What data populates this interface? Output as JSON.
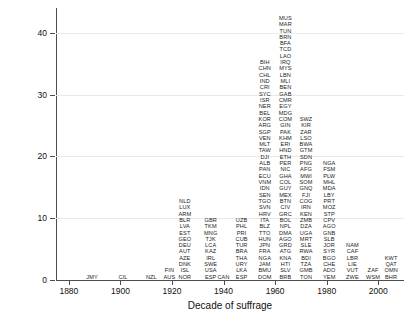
{
  "chart_data": {
    "type": "bar",
    "title": "",
    "xlabel": "Decade of suffrage",
    "ylabel": "Number of countries",
    "xlim": [
      1875,
      2010
    ],
    "ylim": [
      0,
      44
    ],
    "xticks": [
      "1880",
      "1900",
      "1920",
      "1940",
      "1960",
      "1980",
      "2000"
    ],
    "xtick_values": [
      1880,
      1900,
      1920,
      1940,
      1960,
      1980,
      2000
    ],
    "yticks": [
      "0",
      "10",
      "20",
      "30",
      "40"
    ],
    "ytick_values": [
      0,
      10,
      20,
      30,
      40
    ],
    "grid": "horizontal",
    "legend": "none",
    "note": "Each country code is stacked as one unit at its decade of suffrage; column height equals number of countries.",
    "categories": [
      1890,
      1900,
      1910,
      1920,
      1930,
      1940,
      1950,
      1960,
      1970,
      1980,
      1990,
      2000
    ],
    "values": [
      1,
      1,
      2,
      8,
      7,
      18,
      23,
      43,
      25,
      9,
      5,
      4
    ],
    "series": [
      {
        "decade": 1890,
        "count": 1,
        "codes": [
          "JMY"
        ]
      },
      {
        "decade": 1900,
        "count": 1,
        "codes": [
          "CIL"
        ]
      },
      {
        "decade": 1910,
        "count": 2,
        "codes": [
          "FIN",
          "NZL"
        ]
      },
      {
        "decade": 1920,
        "count": 8,
        "codes": [
          "NOR",
          "ISL",
          "DNK",
          "AZE",
          "AUT",
          "DEU",
          "GEO",
          "EST",
          "LVA",
          "BLR",
          "ARM",
          "LUX",
          "NLD"
        ]
      },
      {
        "decade": 1930,
        "count": 7,
        "codes": [
          "CAN",
          "USA",
          "SWE",
          "IRL",
          "KAZ",
          "LCA",
          "TJK",
          "MNG",
          "TKM",
          "GBR"
        ]
      },
      {
        "decade": 1940,
        "count": 18,
        "codes": [
          "ESP",
          "LKA",
          "URY",
          "THA",
          "BRA",
          "TUR",
          "CUB",
          "PRI",
          "PHL",
          "UZB"
        ]
      },
      {
        "decade": 1950,
        "count": 23,
        "codes": [
          "DOM",
          "BMU",
          "JAM",
          "NGA",
          "FRA",
          "JPN",
          "HUN",
          "TTO",
          "BLZ",
          "ITA",
          "HRV",
          "SVN",
          "TGO",
          "SEN",
          "IDN",
          "VNM",
          "ECU",
          "PAN",
          "ALB",
          "DJI",
          "TAW",
          "MLT",
          "VEN",
          "SGP",
          "ARG",
          "KOR",
          "BEL",
          "NER",
          "ISR",
          "SYC",
          "CRI",
          "IND",
          "CHL",
          "CHN",
          "BIH"
        ]
      },
      {
        "decade": 1960,
        "count": 43,
        "codes": [
          "BRB",
          "SLV",
          "HTI",
          "KNA",
          "ATG",
          "GRD",
          "AGO",
          "DMA",
          "NPL",
          "BOL",
          "GRC",
          "CIV",
          "BTN",
          "MEX",
          "GUY",
          "COL",
          "GHA",
          "NIC",
          "PER",
          "ETH",
          "HND",
          "ERI",
          "KHM",
          "PAK",
          "GIN",
          "COM",
          "MDG",
          "EGY",
          "CMR",
          "GAB",
          "BEN",
          "MLI",
          "LBN",
          "MYS",
          "IRQ",
          "LAO",
          "TCD",
          "BFA",
          "BRN",
          "TUN",
          "MAR",
          "MUS"
        ]
      },
      {
        "decade": 1970,
        "count": 25,
        "codes": [
          "TON",
          "GMB",
          "TZA",
          "BDI",
          "RWA",
          "SLE",
          "MRT",
          "UGA",
          "DZA",
          "ZMB",
          "KEN",
          "IRN",
          "COG",
          "FJI",
          "GNQ",
          "SOM",
          "MWI",
          "AFG",
          "PNG",
          "SDN",
          "GTM",
          "BWA",
          "LSO",
          "ZAR",
          "KIR",
          "SWZ"
        ]
      },
      {
        "decade": 1980,
        "count": 9,
        "codes": [
          "YEM",
          "ADO",
          "CHE",
          "BGO",
          "SYR",
          "JOR",
          "SLB",
          "GNB",
          "AGO",
          "CPV",
          "STP",
          "MOZ",
          "PRT",
          "LBY",
          "MDA",
          "MHL",
          "PLW",
          "FSM",
          "NGA"
        ]
      },
      {
        "decade": 1990,
        "count": 5,
        "codes": [
          "ZWE",
          "VUT",
          "LIE",
          "LBR",
          "CAF",
          "NAM"
        ]
      },
      {
        "decade": 2000,
        "count": 4,
        "codes": [
          "BHR",
          "OMN",
          "QAT",
          "KWT"
        ]
      }
    ],
    "columns": [
      {
        "x": 1889,
        "codes": [
          "JMY"
        ]
      },
      {
        "x": 1901,
        "codes": [
          "CIL"
        ]
      },
      {
        "x": 1912,
        "codes": [
          "NZL"
        ]
      },
      {
        "x": 1919,
        "codes": [
          "AUS",
          "FIN"
        ]
      },
      {
        "x": 1925,
        "codes": [
          "NOR",
          "ISL",
          "DNK",
          "AZE",
          "AUT",
          "DEU",
          "GEO",
          "EST",
          "LVA",
          "BLR",
          "ARM",
          "LUX",
          "NLD"
        ]
      },
      {
        "x": 1935,
        "codes": [
          "ESP",
          "USA",
          "SWE",
          "IRL",
          "KAZ",
          "LCA",
          "TJK",
          "MNG",
          "TKM",
          "GBR"
        ]
      },
      {
        "x": 1940,
        "codes": [
          "CAN"
        ]
      },
      {
        "x": 1947,
        "codes": [
          "ESP",
          "LKA",
          "URY",
          "THA",
          "BRA",
          "TUR",
          "CUB",
          "PRI",
          "PHL",
          "UZB"
        ]
      },
      {
        "x": 1956,
        "codes": [
          "DOM",
          "BMU",
          "JAM",
          "NGA",
          "FRA",
          "JPN",
          "HUN",
          "TTO",
          "BLZ",
          "ITA",
          "HRV",
          "SVN",
          "TGO",
          "SEN",
          "IDN",
          "VNM",
          "ECU",
          "PAN",
          "ALB",
          "DJI",
          "TAW",
          "MLT",
          "VEN",
          "SGP",
          "ARG",
          "KOR",
          "BEL",
          "NER",
          "ISR",
          "SYC",
          "CRI",
          "IND",
          "CHL",
          "CHN",
          "BIH"
        ]
      },
      {
        "x": 1964,
        "codes": [
          "BRB",
          "SLV",
          "HTI",
          "KNA",
          "ATG",
          "GRD",
          "AGO",
          "DMA",
          "NPL",
          "BOL",
          "GRC",
          "CIV",
          "BTN",
          "MEX",
          "GUY",
          "COL",
          "GHA",
          "NIC",
          "PER",
          "ETH",
          "HND",
          "ERI",
          "KHM",
          "PAK",
          "GIN",
          "COM",
          "MDG",
          "EGY",
          "CMR",
          "GAB",
          "BEN",
          "MLI",
          "LBN",
          "MYS",
          "IRQ",
          "LAO",
          "TCD",
          "BFA",
          "BRN",
          "TUN",
          "MAR",
          "MUS"
        ]
      },
      {
        "x": 1972,
        "codes": [
          "TON",
          "GMB",
          "TZA",
          "BDI",
          "RWA",
          "SLE",
          "MRT",
          "UGA",
          "DZA",
          "ZMB",
          "KEN",
          "IRN",
          "COG",
          "FJI",
          "GNQ",
          "SOM",
          "MWI",
          "AFG",
          "PNG",
          "SDN",
          "GTM",
          "BWA",
          "LSO",
          "ZAR",
          "KIR",
          "SWZ"
        ]
      },
      {
        "x": 1981,
        "codes": [
          "YEM",
          "ADO",
          "CHE",
          "BGO",
          "SYR",
          "JOR",
          "SLB",
          "GNB",
          "AGO",
          "CPV",
          "STP",
          "MOZ",
          "PRT",
          "LBY",
          "MDA",
          "MHL",
          "PLW",
          "FSM",
          "NGA"
        ]
      },
      {
        "x": 1990,
        "codes": [
          "ZWE",
          "VUT",
          "LIE",
          "LBR",
          "CAF",
          "NAM"
        ]
      },
      {
        "x": 1998,
        "codes": [
          "WSM",
          "ZAF"
        ]
      },
      {
        "x": 2005,
        "codes": [
          "BHR",
          "OMN",
          "QAT",
          "KWT"
        ]
      }
    ]
  }
}
